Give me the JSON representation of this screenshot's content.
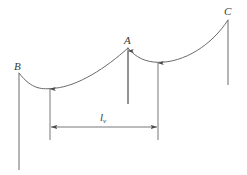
{
  "figure": {
    "type": "engineering-diagram",
    "background_color": "#ffffff",
    "line_color": "#5a5a5a",
    "label_color": "#3a3a3a",
    "labels": {
      "left_support": "B",
      "middle_support": "A",
      "right_support": "C",
      "span_symbol": "l",
      "span_subscript": "v"
    },
    "supports": [
      {
        "name": "B",
        "x": 19,
        "top": 73,
        "bottom": 170
      },
      {
        "name": "A",
        "x": 128,
        "top": 48,
        "bottom": 104
      },
      {
        "name": "C",
        "x": 228,
        "top": 20,
        "bottom": 85
      }
    ],
    "low_point_markers": [
      {
        "x": 50,
        "y": 88,
        "bottom": 140
      },
      {
        "x": 158,
        "y": 62,
        "bottom": 140
      }
    ],
    "dimension_line": {
      "y": 127,
      "x_start": 50,
      "x_end": 158,
      "label": "lv"
    }
  }
}
